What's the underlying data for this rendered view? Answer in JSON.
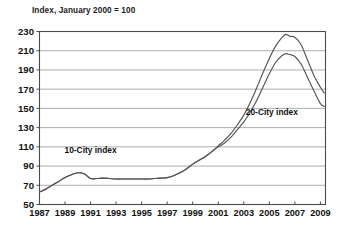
{
  "chart_data": {
    "type": "line",
    "title": "Index, January 2000 = 100",
    "xlabel": "",
    "ylabel": "",
    "xlim": [
      1987,
      2009.4
    ],
    "ylim": [
      50,
      230
    ],
    "grid": true,
    "grid_axis": "y",
    "legend": "inline-annotations",
    "ytick_labels": [
      "230",
      "210",
      "190",
      "170",
      "150",
      "130",
      "110",
      "90",
      "70",
      "50"
    ],
    "yticks": [
      230,
      210,
      190,
      170,
      150,
      130,
      110,
      90,
      70,
      50
    ],
    "xtick_labels": [
      "1987",
      "1989",
      "1991",
      "1993",
      "1995",
      "1997",
      "1999",
      "2001",
      "2003",
      "2005",
      "2007",
      "2009"
    ],
    "xticks": [
      1987,
      1989,
      1991,
      1993,
      1995,
      1997,
      1999,
      2001,
      2003,
      2005,
      2007,
      2009
    ],
    "annotations": [
      {
        "text": "10-City index",
        "x": 1991.0,
        "y": 104
      },
      {
        "text": "20-City index",
        "x": 2005.2,
        "y": 143
      }
    ],
    "series": [
      {
        "name": "10-City index",
        "label": "10-City index",
        "color": "#555555",
        "x": [
          1987.0,
          1987.5,
          1988.0,
          1988.5,
          1989.0,
          1989.5,
          1990.0,
          1990.5,
          1991.0,
          1991.5,
          1992.0,
          1992.5,
          1993.0,
          1993.5,
          1994.0,
          1994.5,
          1995.0,
          1995.5,
          1996.0,
          1996.5,
          1997.0,
          1997.5,
          1998.0,
          1998.5,
          1999.0,
          1999.5,
          2000.0,
          2000.5,
          2001.0,
          2001.5,
          2002.0,
          2002.5,
          2003.0,
          2003.5,
          2004.0,
          2004.5,
          2005.0,
          2005.5,
          2006.0,
          2006.3,
          2006.6,
          2007.0,
          2007.5,
          2008.0,
          2008.5,
          2009.0,
          2009.3
        ],
        "y": [
          63,
          66,
          70,
          74,
          78,
          81,
          83,
          82,
          77,
          77,
          77.5,
          77,
          76.5,
          76.5,
          76.5,
          76.5,
          76.5,
          76.5,
          77,
          77.5,
          78,
          80,
          83,
          87,
          92,
          96,
          100,
          105,
          110,
          114,
          120,
          128,
          136,
          146,
          158,
          172,
          186,
          198,
          205,
          207,
          206,
          204,
          196,
          182,
          168,
          155,
          152
        ],
        "end_value": 152
      },
      {
        "name": "20-City index",
        "label": "20-City index",
        "color": "#555555",
        "x": [
          1987.0,
          1987.5,
          1988.0,
          1988.5,
          1989.0,
          1989.5,
          1990.0,
          1990.5,
          1991.0,
          1991.5,
          1992.0,
          1992.5,
          1993.0,
          1993.5,
          1994.0,
          1994.5,
          1995.0,
          1995.5,
          1996.0,
          1996.5,
          1997.0,
          1997.5,
          1998.0,
          1998.5,
          1999.0,
          1999.5,
          2000.0,
          2000.5,
          2001.0,
          2001.5,
          2002.0,
          2002.5,
          2003.0,
          2003.5,
          2004.0,
          2004.5,
          2005.0,
          2005.5,
          2006.0,
          2006.3,
          2006.6,
          2007.0,
          2007.5,
          2008.0,
          2008.5,
          2009.0,
          2009.3
        ],
        "y": [
          63,
          66,
          70,
          74,
          78,
          81,
          83,
          82,
          77,
          77,
          77.5,
          77,
          76.5,
          76.5,
          76.5,
          76.5,
          76.5,
          76.5,
          77,
          77.5,
          78,
          80,
          83,
          87,
          92,
          96,
          100,
          105,
          111,
          117,
          124,
          133,
          143,
          156,
          171,
          187,
          202,
          215,
          224,
          227,
          225,
          224,
          216,
          200,
          184,
          172,
          166
        ],
        "end_value": 166
      }
    ]
  }
}
